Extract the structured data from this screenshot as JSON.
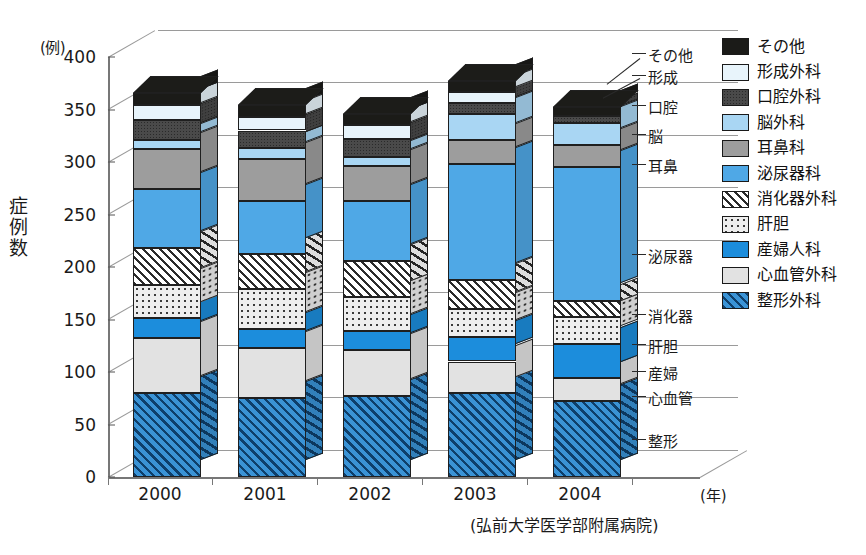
{
  "axis": {
    "y_unit": "(例)",
    "y_title": "症例数",
    "y_ticks": [
      "0",
      "50",
      "100",
      "150",
      "200",
      "250",
      "300",
      "350",
      "400"
    ],
    "x_unit": "(年)",
    "x_categories": [
      "2000",
      "2001",
      "2002",
      "2003",
      "2004"
    ]
  },
  "source_note": "(弘前大学医学部附属病院)",
  "legend": [
    {
      "label": "その他",
      "fill": "f-sonota"
    },
    {
      "label": "形成外科",
      "fill": "f-keisei"
    },
    {
      "label": "口腔外科",
      "fill": "f-koku"
    },
    {
      "label": "脳外科",
      "fill": "f-nou"
    },
    {
      "label": "耳鼻科",
      "fill": "f-jibi"
    },
    {
      "label": "泌尿器科",
      "fill": "f-hinyo"
    },
    {
      "label": "消化器外科",
      "fill": "f-shoka"
    },
    {
      "label": "肝胆",
      "fill": "f-kantan"
    },
    {
      "label": "産婦人科",
      "fill": "f-sanfu"
    },
    {
      "label": "心血管外科",
      "fill": "f-shinkekkan"
    },
    {
      "label": "整形外科",
      "fill": "f-seikei"
    }
  ],
  "callouts": [
    {
      "text": "その他",
      "x": 648,
      "y": 44
    },
    {
      "text": "形成",
      "x": 648,
      "y": 66
    },
    {
      "text": "口腔",
      "x": 648,
      "y": 96
    },
    {
      "text": "脳",
      "x": 648,
      "y": 125
    },
    {
      "text": "耳鼻",
      "x": 648,
      "y": 155
    },
    {
      "text": "泌尿器",
      "x": 648,
      "y": 245
    },
    {
      "text": "消化器",
      "x": 648,
      "y": 305
    },
    {
      "text": "肝胆",
      "x": 648,
      "y": 335
    },
    {
      "text": "産婦",
      "x": 648,
      "y": 362
    },
    {
      "text": "心血管",
      "x": 648,
      "y": 387
    },
    {
      "text": "整形",
      "x": 648,
      "y": 430
    }
  ],
  "chart_data": {
    "type": "bar",
    "subtype": "stacked-3d-column",
    "title": "",
    "xlabel": "(年)",
    "ylabel": "症例数",
    "yunit": "(例)",
    "ylim": [
      0,
      400
    ],
    "ytick_step": 50,
    "grid": true,
    "legend_position": "right",
    "source": "(弘前大学医学部附属病院)",
    "categories": [
      "2000",
      "2001",
      "2002",
      "2003",
      "2004"
    ],
    "series": [
      {
        "name": "整形外科",
        "values": [
          80,
          75,
          77,
          80,
          72
        ]
      },
      {
        "name": "心血管外科",
        "values": [
          52,
          48,
          44,
          30,
          22
        ]
      },
      {
        "name": "産婦人科",
        "values": [
          19,
          18,
          18,
          23,
          33
        ]
      },
      {
        "name": "肝胆",
        "values": [
          32,
          38,
          32,
          27,
          25
        ]
      },
      {
        "name": "消化器外科",
        "values": [
          35,
          33,
          35,
          28,
          16
        ]
      },
      {
        "name": "泌尿器科",
        "values": [
          56,
          51,
          57,
          110,
          127
        ]
      },
      {
        "name": "耳鼻科",
        "values": [
          38,
          40,
          33,
          23,
          21
        ]
      },
      {
        "name": "脳外科",
        "values": [
          9,
          10,
          9,
          25,
          21
        ]
      },
      {
        "name": "口腔外科",
        "values": [
          19,
          17,
          17,
          10,
          7
        ]
      },
      {
        "name": "形成外科",
        "values": [
          14,
          13,
          13,
          11,
          0
        ]
      },
      {
        "name": "その他",
        "values": [
          12,
          11,
          11,
          10,
          8
        ]
      }
    ],
    "totals": [
      368,
      354,
      346,
      377,
      352
    ]
  }
}
